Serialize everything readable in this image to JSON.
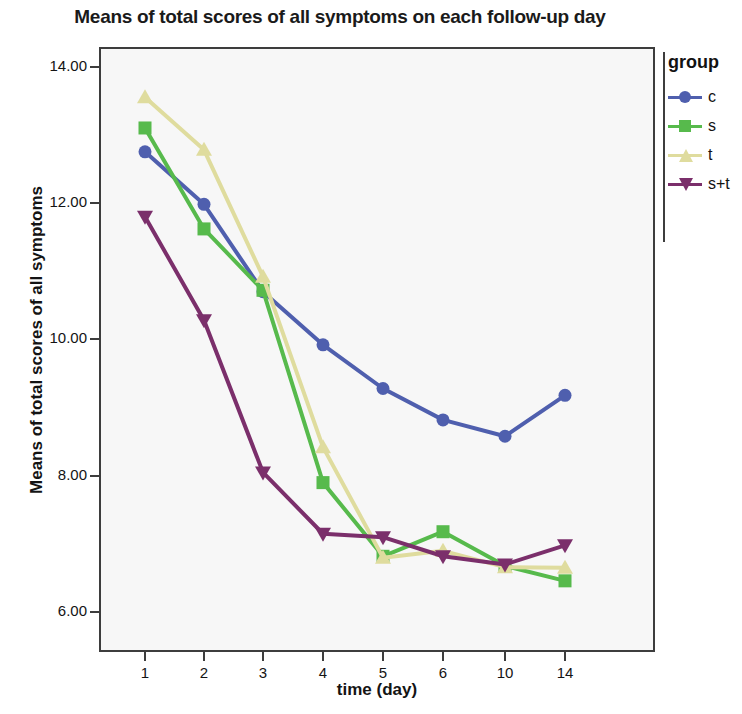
{
  "chart_data": {
    "type": "line",
    "title": "Means of total scores of all symptoms on each follow-up day",
    "xlabel": "time (day)",
    "ylabel": "Means of total scores of all symptoms",
    "categories": [
      "1",
      "2",
      "3",
      "4",
      "5",
      "6",
      "10",
      "14"
    ],
    "ytick_labels": [
      "6.00",
      "8.00",
      "10.00",
      "12.00",
      "14.00"
    ],
    "yticks": [
      6,
      8,
      10,
      12,
      14
    ],
    "ylim": [
      5.2,
      14.6
    ],
    "grid": false,
    "legend_position": "right",
    "legend_title": "group",
    "series": [
      {
        "name": "c",
        "color": "#4f5fae",
        "marker": "circle",
        "values": [
          12.75,
          11.98,
          10.7,
          9.92,
          9.28,
          8.82,
          8.58,
          9.18
        ]
      },
      {
        "name": "s",
        "color": "#57ba4c",
        "marker": "square",
        "values": [
          13.1,
          11.62,
          10.72,
          7.9,
          6.82,
          7.18,
          6.68,
          6.46
        ]
      },
      {
        "name": "t",
        "color": "#dfdc9e",
        "marker": "triangle-up",
        "values": [
          13.55,
          12.78,
          10.92,
          8.42,
          6.8,
          6.9,
          6.66,
          6.65
        ]
      },
      {
        "name": "s+t",
        "color": "#7b2f6b",
        "marker": "triangle-down",
        "values": [
          11.8,
          10.28,
          8.05,
          7.15,
          7.1,
          6.82,
          6.7,
          6.98
        ]
      }
    ]
  },
  "legend": {
    "title": "group",
    "items": [
      {
        "label": "c"
      },
      {
        "label": "s"
      },
      {
        "label": "t"
      },
      {
        "label": "s+t"
      }
    ]
  }
}
